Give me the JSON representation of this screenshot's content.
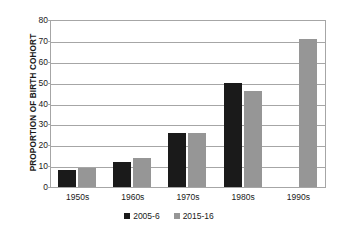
{
  "chart_data": {
    "type": "bar",
    "title": "",
    "subtitle": "",
    "xlabel": "",
    "ylabel": "PROPORTION OF BIRTH COHORT",
    "categories": [
      "1950s",
      "1960s",
      "1970s",
      "1980s",
      "1990s"
    ],
    "series": [
      {
        "name": "2005-6",
        "color": "#1a1a1a",
        "values": [
          8,
          12,
          26,
          50,
          null
        ]
      },
      {
        "name": "2015-16",
        "color": "#969696",
        "values": [
          9,
          14,
          26,
          46,
          71
        ]
      }
    ],
    "ylim": [
      0,
      80
    ],
    "ytick_step": 10,
    "yticks": [
      80,
      70,
      60,
      50,
      40,
      30,
      20,
      10,
      0
    ],
    "ytick_labels": [
      "80",
      "70",
      "60",
      "50",
      "40",
      "30",
      "20",
      "10",
      "0"
    ],
    "grid": "horizontal",
    "legend_position": "bottom-center",
    "annotations": []
  },
  "colors": {
    "series_2005_6": "#1a1a1a",
    "series_2015_16": "#969696",
    "gridline": "#a6a6a6",
    "axis": "#a6a6a6",
    "text": "#1a1a1a",
    "background": "#ffffff"
  }
}
